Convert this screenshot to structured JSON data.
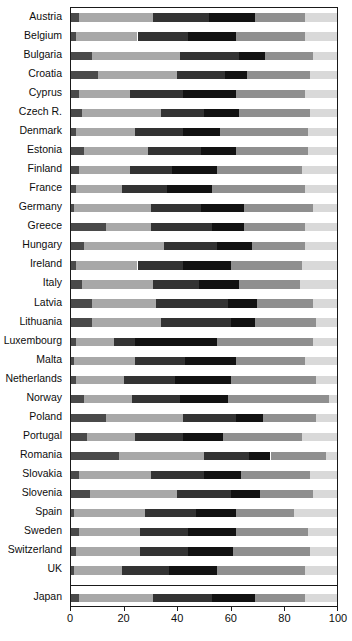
{
  "chart_data": {
    "type": "bar",
    "orientation": "horizontal",
    "stacked": true,
    "percent": true,
    "title": "",
    "subtitle": "",
    "xlabel": "",
    "ylabel": "",
    "xlim": [
      0,
      100
    ],
    "xticks": [
      0,
      20,
      40,
      60,
      80,
      100
    ],
    "xticklabels": [
      "0",
      "20",
      "40",
      "60",
      "80",
      "100"
    ],
    "grid": false,
    "legend": null,
    "legend_position": "none",
    "series": [
      {
        "name": "segment-1",
        "color": "#4a4a4a"
      },
      {
        "name": "segment-2",
        "color": "#a8a8a8"
      },
      {
        "name": "segment-3",
        "color": "#333333"
      },
      {
        "name": "segment-4",
        "color": "#121212"
      },
      {
        "name": "segment-5",
        "color": "#8f8f8f"
      },
      {
        "name": "segment-6",
        "color": "#d9d9d9"
      }
    ],
    "categories": [
      "Austria",
      "Belgium",
      "Bulgaria",
      "Croatia",
      "Cyprus",
      "Czech R.",
      "Denmark",
      "Estonia",
      "Finland",
      "France",
      "Germany",
      "Greece",
      "Hungary",
      "Ireland",
      "Italy",
      "Latvia",
      "Lithuania",
      "Luxembourg",
      "Malta",
      "Netherlands",
      "Norway",
      "Poland",
      "Portugal",
      "Romania",
      "Slovakia",
      "Slovenia",
      "Spain",
      "Sweden",
      "Switzerland",
      "UK",
      "Japan"
    ],
    "values": [
      [
        3,
        28,
        21,
        17,
        19,
        12
      ],
      [
        2,
        23,
        19,
        18,
        26,
        12
      ],
      [
        8,
        33,
        22,
        10,
        18,
        9
      ],
      [
        10,
        30,
        18,
        8,
        24,
        10
      ],
      [
        3,
        19,
        20,
        20,
        26,
        12
      ],
      [
        4,
        30,
        16,
        13,
        27,
        10
      ],
      [
        2,
        22,
        18,
        14,
        33,
        11
      ],
      [
        5,
        24,
        20,
        13,
        27,
        11
      ],
      [
        3,
        19,
        16,
        17,
        32,
        13
      ],
      [
        2,
        17,
        17,
        17,
        35,
        12
      ],
      [
        1,
        29,
        19,
        16,
        26,
        9
      ],
      [
        13,
        17,
        23,
        12,
        23,
        12
      ],
      [
        5,
        30,
        20,
        13,
        20,
        12
      ],
      [
        2,
        23,
        17,
        18,
        27,
        13
      ],
      [
        4,
        27,
        17,
        15,
        23,
        14
      ],
      [
        8,
        24,
        27,
        11,
        21,
        9
      ],
      [
        8,
        26,
        26,
        9,
        23,
        8
      ],
      [
        2,
        14,
        8,
        31,
        36,
        9
      ],
      [
        1,
        23,
        19,
        19,
        26,
        12
      ],
      [
        2,
        18,
        19,
        21,
        32,
        8
      ],
      [
        5,
        18,
        18,
        18,
        38,
        3
      ],
      [
        13,
        29,
        20,
        10,
        20,
        8
      ],
      [
        6,
        18,
        18,
        15,
        30,
        13
      ],
      [
        18,
        32,
        17,
        8,
        21,
        4
      ],
      [
        3,
        27,
        20,
        14,
        26,
        10
      ],
      [
        7,
        33,
        20,
        11,
        20,
        9
      ],
      [
        1,
        27,
        19,
        15,
        22,
        16
      ],
      [
        3,
        23,
        18,
        18,
        27,
        11
      ],
      [
        2,
        24,
        18,
        17,
        29,
        10
      ],
      [
        1,
        18,
        18,
        18,
        33,
        12
      ],
      [
        3,
        28,
        22,
        16,
        19,
        12
      ]
    ]
  }
}
